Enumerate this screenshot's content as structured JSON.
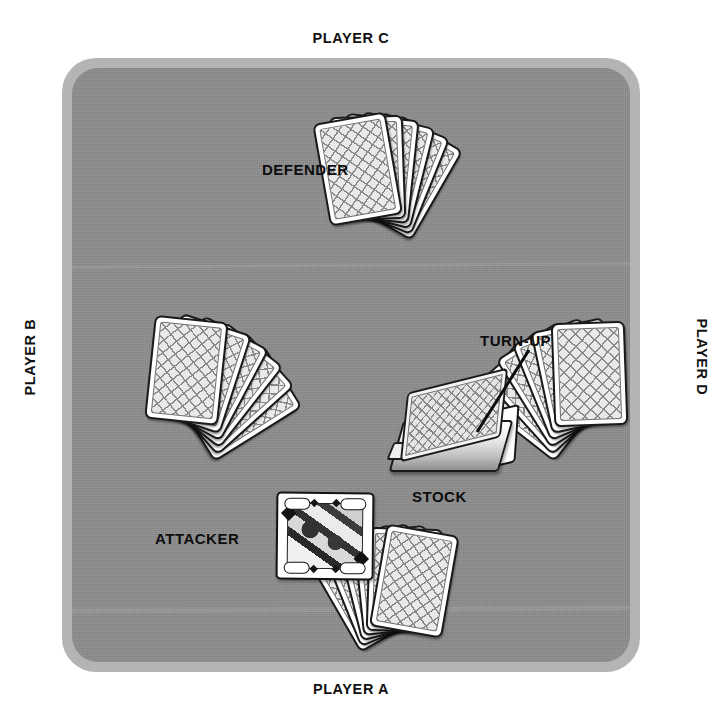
{
  "diagram": {
    "table": {
      "felt_color": "#8d8d8d",
      "rim_color": "#b4b4b4"
    },
    "outer_labels": [
      {
        "id": "player-c",
        "text": "PLAYER C",
        "position": "top"
      },
      {
        "id": "player-b",
        "text": "PLAYER B",
        "position": "left"
      },
      {
        "id": "player-d",
        "text": "PLAYER D",
        "position": "right"
      },
      {
        "id": "player-a",
        "text": "PLAYER A",
        "position": "bottom"
      }
    ],
    "table_labels": [
      {
        "id": "defender",
        "text": "DEFENDER"
      },
      {
        "id": "attacker",
        "text": "ATTACKER"
      },
      {
        "id": "stock",
        "text": "STOCK"
      },
      {
        "id": "turn-up",
        "text": "TURN-UP"
      }
    ],
    "dealer_button": {
      "text": "D",
      "background": "#0c0c0c",
      "text_color": "#ffffff"
    },
    "hands": [
      {
        "id": "hand-player-c",
        "owner": "PLAYER C",
        "role": "DEFENDER",
        "card_count": 6,
        "face": "down"
      },
      {
        "id": "hand-player-b",
        "owner": "PLAYER B",
        "role": "ATTACKER",
        "card_count": 6,
        "face": "down"
      },
      {
        "id": "hand-player-d",
        "owner": "PLAYER D",
        "role": "",
        "card_count": 6,
        "face": "down"
      },
      {
        "id": "hand-player-a",
        "owner": "PLAYER A",
        "role": "",
        "card_count": 6,
        "face": "down"
      }
    ],
    "stock_pile": {
      "label": "STOCK",
      "face": "down",
      "turn_up_card_suit": "spades",
      "turn_up_visible": true
    },
    "played_card": {
      "id": "played-card",
      "type": "court card",
      "suit": "diamonds",
      "face": "up"
    }
  }
}
